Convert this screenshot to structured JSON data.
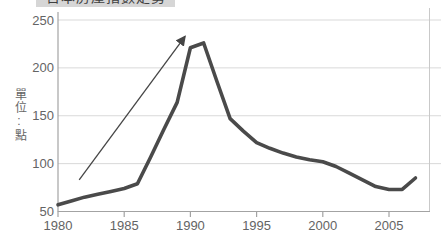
{
  "chart_data": {
    "type": "line",
    "title": "日本房產指數走勢",
    "y_axis_unit_label": "單位:點",
    "x": [
      1980,
      1981,
      1982,
      1983,
      1984,
      1985,
      1986,
      1987,
      1988,
      1989,
      1990,
      1991,
      1992,
      1993,
      1994,
      1995,
      1996,
      1997,
      1998,
      1999,
      2000,
      2001,
      2002,
      2003,
      2004,
      2005,
      2006,
      2007
    ],
    "values": [
      57,
      61,
      65,
      68,
      71,
      74,
      79,
      107,
      136,
      164,
      221,
      226,
      186,
      147,
      134,
      122,
      116,
      111,
      107,
      104,
      102,
      97,
      90,
      83,
      76,
      73,
      73,
      85
    ],
    "x_ticks": [
      1980,
      1985,
      1990,
      1995,
      2000,
      2005
    ],
    "y_ticks": [
      50,
      100,
      150,
      200,
      250
    ],
    "ylim": [
      50,
      250
    ],
    "xlim": [
      1980,
      2008
    ],
    "grid": true,
    "legend": "none",
    "line_color": "#4a4a4a",
    "grid_color": "#d9d9d9",
    "axis_color": "#a3a3a3",
    "annotation_arrow": {
      "from_x": 1981.6,
      "from_y": 83,
      "to_x": 1989.6,
      "to_y": 233,
      "color": "#454545"
    }
  }
}
